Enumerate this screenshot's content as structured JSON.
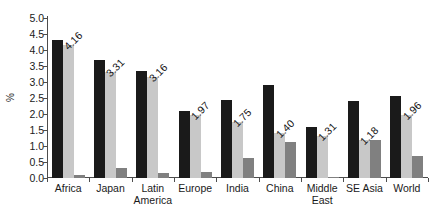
{
  "chart_data": {
    "type": "bar",
    "title": "",
    "xlabel": "",
    "ylabel": "%",
    "ylim": [
      0.0,
      5.0
    ],
    "ytick_step": 0.5,
    "grid": false,
    "legend": "none",
    "orientation": "vertical",
    "grouping": "grouped",
    "label_rotation_deg": -45,
    "categories": [
      "Africa",
      "Latin America",
      "Japan",
      "Europe",
      "India",
      "China",
      "Middle East",
      "SE Asia",
      "World"
    ],
    "category_lines": [
      [
        "Africa",
        ""
      ],
      [
        "Japan",
        ""
      ],
      [
        "Latin",
        "America"
      ],
      [
        "Europe",
        ""
      ],
      [
        "India",
        ""
      ],
      [
        "China",
        ""
      ],
      [
        "Middle",
        "East"
      ],
      [
        "SE Asia",
        ""
      ],
      [
        "World",
        ""
      ]
    ],
    "ytick_labels": [
      "5.0",
      "4.5",
      "4.0",
      "3.5",
      "3.0",
      "2.5",
      "2.0",
      "1.5",
      "1.0",
      "0.5",
      "0.0"
    ],
    "ytick_values": [
      5.0,
      4.5,
      4.0,
      3.5,
      3.0,
      2.5,
      2.0,
      1.5,
      1.0,
      0.5,
      0.0
    ],
    "series": [
      {
        "name": "series-1",
        "color": "#1a1a1a",
        "values": [
          4.3,
          3.7,
          3.35,
          2.08,
          2.45,
          2.92,
          1.58,
          2.42,
          2.55
        ]
      },
      {
        "name": "series-2",
        "color": "#c8c8c8",
        "values": [
          4.16,
          3.31,
          3.16,
          1.97,
          1.75,
          1.4,
          1.31,
          1.18,
          1.96
        ],
        "labels": [
          "4.16",
          "3.31",
          "3.16",
          "1.97",
          "1.75",
          "1.40",
          "1.31",
          "1.18",
          "1.96"
        ]
      },
      {
        "name": "series-3",
        "color": "#808080",
        "values": [
          0.08,
          0.3,
          0.15,
          0.2,
          0.62,
          1.12,
          0.04,
          1.18,
          0.68
        ]
      }
    ]
  }
}
